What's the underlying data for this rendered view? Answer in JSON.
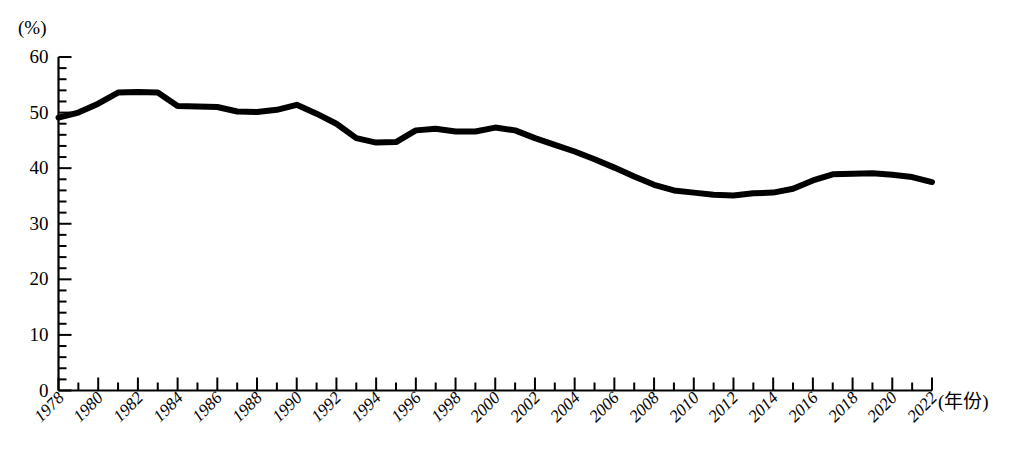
{
  "chart_data": {
    "type": "line",
    "title": "",
    "xlabel": "(年份)",
    "ylabel": "(%)",
    "xlim": [
      1978,
      2022
    ],
    "ylim": [
      0,
      60
    ],
    "ytick_values": [
      0,
      10,
      20,
      30,
      40,
      50,
      60
    ],
    "ytick_labels": [
      "0",
      "10",
      "20",
      "30",
      "40",
      "50",
      "60"
    ],
    "y_minor_tick_step": 2,
    "x_minor_tick_step": 1,
    "x_major_tick_step": 2,
    "xtick_labels": [
      "1978",
      "1980",
      "1982",
      "1984",
      "1986",
      "1988",
      "1990",
      "1992",
      "1994",
      "1996",
      "1998",
      "2000",
      "2002",
      "2004",
      "2006",
      "2008",
      "2010",
      "2012",
      "2014",
      "2016",
      "2018",
      "2020",
      "2022"
    ],
    "grid": false,
    "legend": false,
    "legend_position": "none",
    "line_color": "#000000",
    "line_width": 6,
    "series": [
      {
        "name": "",
        "x": [
          1978,
          1979,
          1980,
          1981,
          1982,
          1983,
          1984,
          1985,
          1986,
          1987,
          1988,
          1989,
          1990,
          1991,
          1992,
          1993,
          1994,
          1995,
          1996,
          1997,
          1998,
          1999,
          2000,
          2001,
          2002,
          2003,
          2004,
          2005,
          2006,
          2007,
          2008,
          2009,
          2010,
          2011,
          2012,
          2013,
          2014,
          2015,
          2016,
          2017,
          2018,
          2019,
          2020,
          2021,
          2022
        ],
        "values": [
          49.1,
          50.0,
          51.6,
          53.6,
          53.7,
          53.6,
          51.2,
          51.1,
          51.0,
          50.2,
          50.1,
          50.5,
          51.4,
          49.8,
          48.0,
          45.4,
          44.6,
          44.7,
          46.8,
          47.1,
          46.6,
          46.6,
          47.3,
          46.8,
          45.4,
          44.2,
          43.0,
          41.6,
          40.1,
          38.5,
          37.0,
          36.0,
          35.6,
          35.2,
          35.1,
          35.5,
          35.6,
          36.3,
          37.8,
          38.9,
          39.0,
          39.1,
          38.8,
          38.4,
          37.5
        ]
      }
    ]
  }
}
